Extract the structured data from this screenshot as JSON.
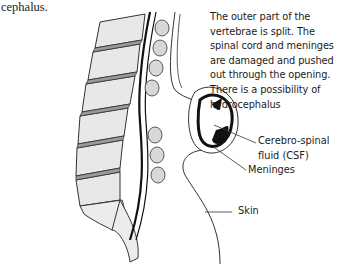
{
  "caption_fragment": "cephalus.",
  "description": {
    "lines": [
      "The outer part of the",
      "vertebrae is split. The",
      "spinal cord and meninges",
      "are damaged and pushed",
      "out through the opening.",
      "There is a possibility of",
      "hydrocephalus"
    ]
  },
  "labels": {
    "csf_line1": "Cerebro-spinal",
    "csf_line2": "fluid (CSF)",
    "meninges": "Meninges",
    "skin": "Skin"
  },
  "colors": {
    "ink": "#1c1c1c",
    "bone_fill": "#e6e6e6",
    "disc_fill": "#9a9a9a",
    "cord": "#111111"
  }
}
